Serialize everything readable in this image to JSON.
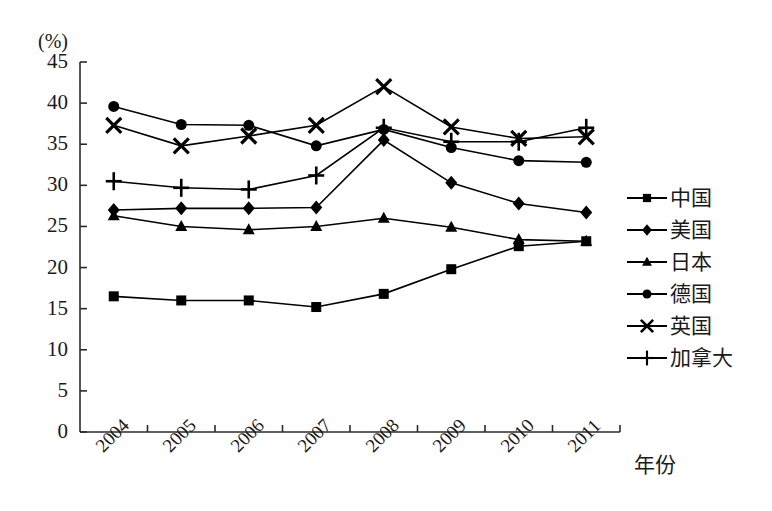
{
  "chart_data": {
    "type": "line",
    "title": "",
    "subtitle": "",
    "ylabel": "(%)",
    "xlabel": "年份",
    "x": [
      "2004",
      "2005",
      "2006",
      "2007",
      "2008",
      "2009",
      "2010",
      "2011"
    ],
    "categories": [
      "2004",
      "2005",
      "2006",
      "2007",
      "2008",
      "2009",
      "2010",
      "2011"
    ],
    "ylim": [
      0,
      45
    ],
    "yticks": [
      0,
      5,
      10,
      15,
      20,
      25,
      30,
      35,
      40,
      45
    ],
    "ytick_labels": [
      "0",
      "5",
      "10",
      "15",
      "20",
      "25",
      "30",
      "35",
      "40",
      "45"
    ],
    "grid": false,
    "legend_position": "right",
    "series": [
      {
        "name": "中国",
        "marker": "square",
        "color": "#000000",
        "values": [
          16.5,
          16.0,
          16.0,
          15.2,
          16.8,
          19.8,
          22.6,
          23.2
        ]
      },
      {
        "name": "美国",
        "marker": "diamond",
        "color": "#000000",
        "values": [
          27.0,
          27.2,
          27.2,
          27.3,
          35.5,
          30.3,
          27.8,
          26.7
        ]
      },
      {
        "name": "日本",
        "marker": "triangle",
        "color": "#000000",
        "values": [
          26.3,
          25.0,
          24.6,
          25.0,
          26.0,
          24.9,
          23.4,
          23.2
        ]
      },
      {
        "name": "德国",
        "marker": "circle",
        "color": "#000000",
        "values": [
          39.6,
          37.4,
          37.3,
          34.8,
          36.8,
          34.6,
          33.0,
          32.8
        ]
      },
      {
        "name": "英国",
        "marker": "cross",
        "color": "#000000",
        "values": [
          37.3,
          34.8,
          36.0,
          37.3,
          42.0,
          37.1,
          35.7,
          35.9
        ]
      },
      {
        "name": "加拿大",
        "marker": "plus",
        "color": "#000000",
        "values": [
          30.5,
          29.7,
          29.5,
          31.2,
          37.0,
          35.3,
          35.3,
          37.0
        ]
      }
    ]
  },
  "legend": {
    "items": [
      {
        "label": "中国",
        "marker": "square"
      },
      {
        "label": "美国",
        "marker": "diamond"
      },
      {
        "label": "日本",
        "marker": "triangle"
      },
      {
        "label": "德国",
        "marker": "circle"
      },
      {
        "label": "英国",
        "marker": "cross"
      },
      {
        "label": "加拿大",
        "marker": "plus"
      }
    ]
  },
  "axes": {
    "y_unit": "(%)",
    "x_title": "年份"
  }
}
